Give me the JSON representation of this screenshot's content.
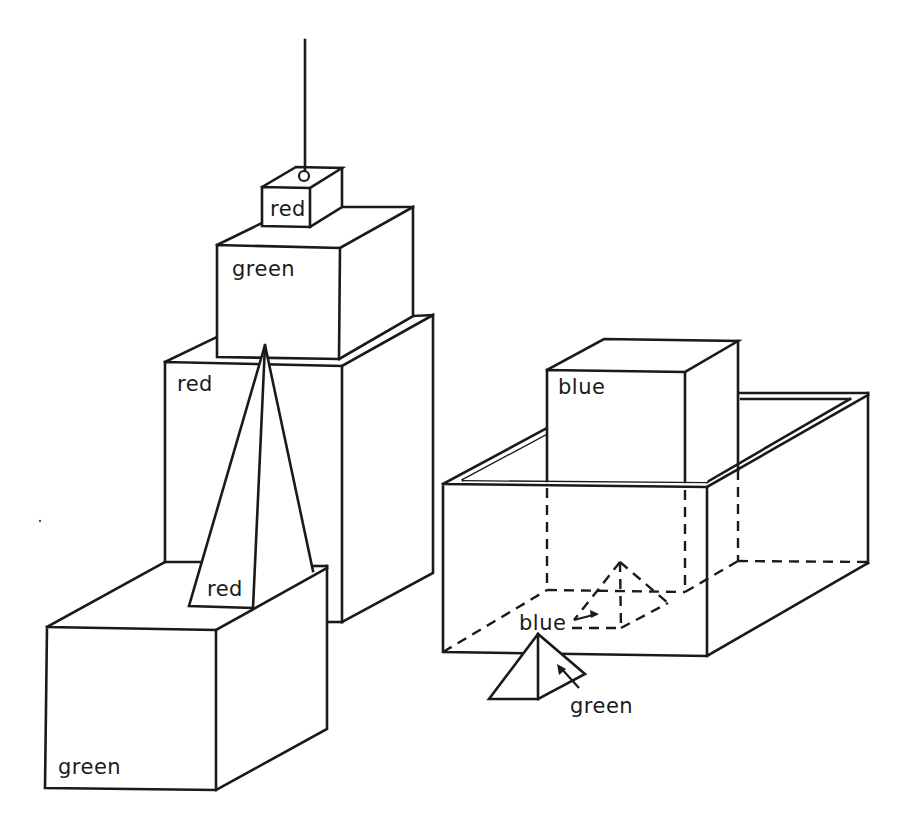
{
  "figure": {
    "objects": [
      {
        "id": "hand",
        "kind": "hand",
        "label": ""
      },
      {
        "id": "small-block",
        "kind": "block",
        "color": "red",
        "label": "red"
      },
      {
        "id": "green-top-block",
        "kind": "block",
        "color": "green",
        "label": "green"
      },
      {
        "id": "tall-block",
        "kind": "block",
        "color": "red",
        "label": "red"
      },
      {
        "id": "tall-pyramid",
        "kind": "pyramid",
        "color": "red",
        "label": "red"
      },
      {
        "id": "front-block",
        "kind": "block",
        "color": "green",
        "label": "green"
      },
      {
        "id": "box",
        "kind": "box",
        "color": "",
        "label": ""
      },
      {
        "id": "box-block",
        "kind": "block",
        "color": "blue",
        "label": "blue"
      },
      {
        "id": "hidden-pyramid",
        "kind": "pyramid",
        "color": "blue",
        "label": "blue"
      },
      {
        "id": "floor-pyramid",
        "kind": "pyramid",
        "color": "green",
        "label": "green"
      }
    ]
  },
  "labels": {
    "small_block": "red",
    "green_top_block": "green",
    "tall_block": "red",
    "tall_pyramid": "red",
    "front_block": "green",
    "box_block": "blue",
    "hidden_pyramid": "blue",
    "floor_pyramid": "green"
  }
}
